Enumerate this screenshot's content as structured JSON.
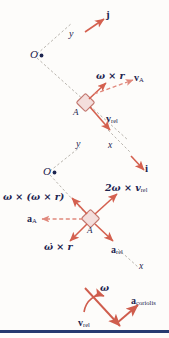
{
  "figure": {
    "colors": {
      "arrow_red": "#d4604f",
      "arrow_dashed_red": "#e08a7e",
      "axis_gray": "#b9b5ae",
      "label_navy": "#1d2550",
      "block_fill": "#f4dedc",
      "block_stroke": "#c2776f",
      "baseline_blue": "#263a70",
      "background": "#fdfcfa"
    },
    "panels": [
      {
        "name": "velocity-panel",
        "origin_label": "O",
        "axis_y_label": "y",
        "axis_x_label": "x",
        "unit_vector_label": "j",
        "block_label": "A",
        "vectors": [
          {
            "name": "omega-cross-r",
            "label": "ω × r",
            "style": "solid"
          },
          {
            "name": "v-A",
            "label": "v",
            "sub": "A",
            "style": "dashed"
          },
          {
            "name": "v-rel",
            "label": "v",
            "sub": "rel",
            "style": "solid"
          }
        ]
      },
      {
        "name": "acceleration-panel",
        "origin_label": "O",
        "axis_y_label": "y",
        "axis_x_label": "x",
        "unit_vector_label": "i",
        "block_label": "A",
        "vectors": [
          {
            "name": "omega-cross-omega-cross-r",
            "label": "ω × (ω × r)",
            "style": "solid"
          },
          {
            "name": "two-omega-cross-v-rel",
            "label": "2ω × v",
            "sub": "rel",
            "style": "solid"
          },
          {
            "name": "a-A",
            "label": "a",
            "sub": "A",
            "style": "dashed"
          },
          {
            "name": "omega-dot-cross-r",
            "label": "ω̇ × r",
            "style": "solid"
          },
          {
            "name": "a-rel",
            "label": "a",
            "sub": "rel",
            "style": "solid"
          }
        ]
      },
      {
        "name": "coriolis-panel",
        "vectors": [
          {
            "name": "omega-curved",
            "label": "ω",
            "style": "curved"
          },
          {
            "name": "v-rel",
            "label": "v",
            "sub": "rel",
            "style": "solid"
          },
          {
            "name": "a-coriolis",
            "label": "a",
            "sub": "coriolis",
            "style": "solid"
          }
        ]
      }
    ],
    "labels": {
      "O_top": "O",
      "y_top": "y",
      "j_top": "j",
      "x_top": "x",
      "A_top": "A",
      "omega_cross_r": "ω × r",
      "vA_main": "v",
      "vA_sub": "A",
      "vrel_main": "v",
      "vrel_sub": "rel",
      "O_bot": "O",
      "y_bot": "y",
      "x_bot_upper": "x",
      "i_bot": "i",
      "A_bot": "A",
      "x_bot_lower": "x",
      "omega_cross_omega_cross_r": "ω × (ω × r)",
      "two_omega_cross_vrel_main": "2ω × v",
      "two_omega_cross_vrel_sub": "rel",
      "aA_main": "a",
      "aA_sub": "A",
      "omega_dot_cross_r": "ω̇ × r",
      "arel_main": "a",
      "arel_sub": "rel",
      "omega_cor": "ω",
      "vrel_cor_main": "v",
      "vrel_cor_sub": "rel",
      "acoriolis_main": "a",
      "acoriolis_sub": "coriolis"
    }
  }
}
